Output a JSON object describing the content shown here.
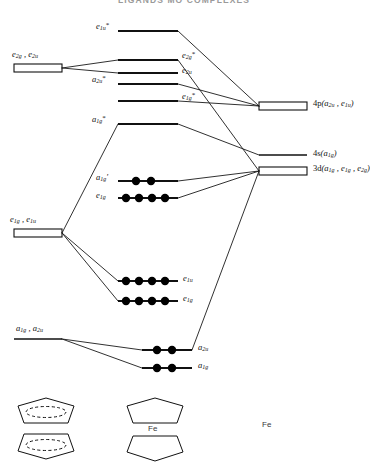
{
  "title": "LIGANDS MO COMPLEXES",
  "diagram": {
    "type": "molecular-orbital-energy-level-diagram",
    "molecule": "ferrocene",
    "metal_label": "Fe",
    "left_column_caption": "ligand group orbitals",
    "right_column_caption": "metal atomic orbitals",
    "ligand_group_orbitals": [
      {
        "id": "lgo-e2g-e2u",
        "label": "e2g , e2u",
        "label_html": "e<sub>2g</sub> , e<sub>2u</sub>",
        "shape": "box",
        "x": 14,
        "y": 64,
        "w": 48,
        "h": 8
      },
      {
        "id": "lgo-e1g-e1u",
        "label": "e1g , e1u",
        "label_html": "e<sub>1g</sub> , e<sub>1u</sub>",
        "shape": "box",
        "x": 14,
        "y": 229,
        "w": 48,
        "h": 8
      },
      {
        "id": "lgo-a1g-a2u",
        "label": "a1g , a2u",
        "label_html": "a<sub>1g</sub> , a<sub>2u</sub>",
        "shape": "line",
        "x": 14,
        "y": 339,
        "w": 48,
        "h": 0
      }
    ],
    "metal_orbitals": [
      {
        "id": "ao-4p",
        "label": "4p(a2u , e1u)",
        "label_html": "4<span class='rm'>p</span>(<i>a</i><sub>2u</sub> , <i>e</i><sub>1u</sub>)",
        "shape": "box",
        "x": 259,
        "y": 102,
        "w": 48,
        "h": 8
      },
      {
        "id": "ao-4s",
        "label": "4s(a1g)",
        "label_html": "4<span class='rm'>s</span>(<i>a</i><sub>1g</sub>)",
        "shape": "line",
        "x": 259,
        "y": 155,
        "w": 48,
        "h": 0
      },
      {
        "id": "ao-3d",
        "label": "3d(a1g , e1g , e2g)",
        "label_html": "3<span class='rm'>d</span>(<i>a</i><sub>1g</sub> , <i>e</i><sub>1g</sub> , <i>e</i><sub>2g</sub>)",
        "shape": "box",
        "x": 259,
        "y": 167,
        "w": 48,
        "h": 8
      }
    ],
    "molecular_orbitals": [
      {
        "id": "mo-e1u-star",
        "label": "e1u*",
        "label_html": "<i>e</i><sub>1u</sub><sup>*</sup>",
        "x1": 118,
        "x2": 178,
        "y": 31,
        "electrons": 0,
        "label_side": "left",
        "type": "antibonding"
      },
      {
        "id": "mo-e2g-star",
        "label": "e2g*",
        "label_html": "<i>e</i><sub>2g</sub><sup>*</sup>",
        "x1": 118,
        "x2": 178,
        "y": 60,
        "electrons": 0,
        "label_side": "right",
        "type": "antibonding"
      },
      {
        "id": "mo-e2u",
        "label": "e2u",
        "label_html": "<i>e</i><sub>2u</sub>",
        "x1": 118,
        "x2": 178,
        "y": 73,
        "electrons": 0,
        "label_side": "right",
        "type": "nonbonding"
      },
      {
        "id": "mo-a2u-star",
        "label": "a2u*",
        "label_html": "<i>a</i><sub>2u</sub><sup>*</sup>",
        "x1": 118,
        "x2": 178,
        "y": 84,
        "electrons": 0,
        "label_side": "left",
        "type": "antibonding"
      },
      {
        "id": "mo-e1g-star",
        "label": "e1g*",
        "label_html": "<i>e</i><sub>1g</sub><sup>*</sup>",
        "x1": 118,
        "x2": 178,
        "y": 101,
        "electrons": 0,
        "label_side": "right",
        "type": "antibonding"
      },
      {
        "id": "mo-a1g-star",
        "label": "a1g*",
        "label_html": "<i>a</i><sub>1g</sub><sup>*</sup>",
        "x1": 118,
        "x2": 178,
        "y": 124,
        "electrons": 0,
        "label_side": "left",
        "type": "antibonding"
      },
      {
        "id": "mo-a1g-prime",
        "label": "a1g'",
        "label_html": "<i>a</i><sub>1g</sub>&prime;",
        "x1": 118,
        "x2": 178,
        "y": 181,
        "electrons": 2,
        "label_side": "left",
        "type": "nonbonding"
      },
      {
        "id": "mo-e1g-nb",
        "label": "e1g",
        "label_html": "<i>e</i><sub>1g</sub>",
        "x1": 118,
        "x2": 178,
        "y": 198,
        "electrons": 4,
        "label_side": "left",
        "type": "nonbonding"
      },
      {
        "id": "mo-e1u-b",
        "label": "e1u",
        "label_html": "<i>e</i><sub>1u</sub>",
        "x1": 118,
        "x2": 178,
        "y": 281,
        "electrons": 4,
        "label_side": "right",
        "type": "bonding"
      },
      {
        "id": "mo-e1g-b",
        "label": "e1g",
        "label_html": "<i>e</i><sub>1g</sub>",
        "x1": 118,
        "x2": 178,
        "y": 301,
        "electrons": 4,
        "label_side": "right",
        "type": "bonding"
      },
      {
        "id": "mo-a2u-b",
        "label": "a2u",
        "label_html": "<i>a</i><sub>2u</sub>",
        "x1": 142,
        "x2": 192,
        "y": 350,
        "electrons": 2,
        "label_side": "right",
        "type": "bonding"
      },
      {
        "id": "mo-a1g-b",
        "label": "a1g",
        "label_html": "<i>a</i><sub>1g</sub>",
        "x1": 142,
        "x2": 192,
        "y": 368,
        "electrons": 2,
        "label_side": "right",
        "type": "bonding"
      }
    ],
    "structures": [
      {
        "id": "struct-ligands",
        "caption": "",
        "x": 22,
        "y": 398,
        "kind": "two-cp-rings-with-aromatic-circle"
      },
      {
        "id": "struct-complex",
        "caption": "Fe",
        "x": 130,
        "y": 398,
        "kind": "ferrocene-sandwich"
      },
      {
        "id": "struct-metal",
        "caption": "Fe",
        "x": 262,
        "y": 420,
        "kind": "bare-metal-atom"
      }
    ],
    "colors": {
      "ink": "#111111",
      "line": "#1a1a1a",
      "electron": "#000000",
      "title": "#9a9a9a"
    }
  }
}
